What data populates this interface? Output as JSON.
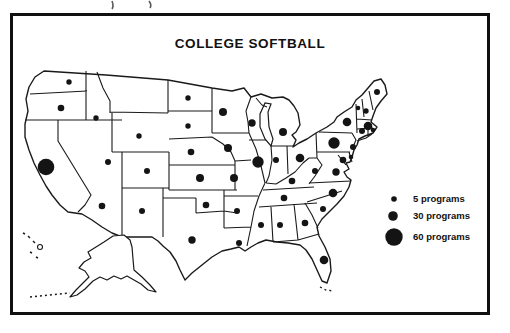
{
  "title": "COLLEGE SOFTBALL",
  "colors": {
    "ink": "#141414",
    "paper": "#ffffff"
  },
  "chart_data": {
    "type": "proportional-symbol-map",
    "title": "COLLEGE SOFTBALL",
    "region": "United States (48 contiguous states drawn, plus Alaska and Hawaii outlines)",
    "unit": "college softball programs per state (dot area ~ program count)",
    "symbol_color": "#141414",
    "legend_position": "right-middle",
    "legend": [
      {
        "label": "5 programs",
        "value": 5,
        "cx": 394,
        "cy": 199,
        "r": 2.8
      },
      {
        "label": "30 programs",
        "value": 30,
        "cx": 393,
        "cy": 216,
        "r": 4.8
      },
      {
        "label": "60 programs",
        "value": 60,
        "cx": 394,
        "cy": 237,
        "r": 8.7
      }
    ],
    "dots": [
      {
        "state": "WA",
        "x": 69,
        "y": 82,
        "r": 2.7,
        "programs_est": 5
      },
      {
        "state": "OR",
        "x": 61,
        "y": 108,
        "r": 3.3,
        "programs_est": 12
      },
      {
        "state": "ID",
        "x": 96,
        "y": 118,
        "r": 2.7,
        "programs_est": 5
      },
      {
        "state": "NV",
        "x": 108,
        "y": 162,
        "r": 3.0,
        "programs_est": 9
      },
      {
        "state": "WY",
        "x": 139,
        "y": 136,
        "r": 2.7,
        "programs_est": 5
      },
      {
        "state": "CO",
        "x": 147,
        "y": 171,
        "r": 3.0,
        "programs_est": 9
      },
      {
        "state": "AZ",
        "x": 102,
        "y": 206,
        "r": 3.3,
        "programs_est": 12
      },
      {
        "state": "NM",
        "x": 142,
        "y": 211,
        "r": 3.0,
        "programs_est": 9
      },
      {
        "state": "CA",
        "x": 46,
        "y": 167,
        "r": 8.3,
        "programs_est": 57
      },
      {
        "state": "ND",
        "x": 188,
        "y": 98,
        "r": 2.7,
        "programs_est": 5
      },
      {
        "state": "SD",
        "x": 188,
        "y": 126,
        "r": 2.7,
        "programs_est": 5
      },
      {
        "state": "NE",
        "x": 191,
        "y": 152,
        "r": 3.3,
        "programs_est": 12
      },
      {
        "state": "KS",
        "x": 200,
        "y": 178,
        "r": 4.0,
        "programs_est": 21
      },
      {
        "state": "OK",
        "x": 206,
        "y": 205,
        "r": 3.3,
        "programs_est": 12
      },
      {
        "state": "TX",
        "x": 192,
        "y": 240,
        "r": 3.7,
        "programs_est": 17
      },
      {
        "state": "MN",
        "x": 223,
        "y": 112,
        "r": 4.0,
        "programs_est": 21
      },
      {
        "state": "IA",
        "x": 228,
        "y": 148,
        "r": 4.0,
        "programs_est": 21
      },
      {
        "state": "MO",
        "x": 234,
        "y": 178,
        "r": 4.0,
        "programs_est": 21
      },
      {
        "state": "AR",
        "x": 237,
        "y": 211,
        "r": 3.0,
        "programs_est": 9
      },
      {
        "state": "LA",
        "x": 239,
        "y": 243,
        "r": 3.0,
        "programs_est": 9
      },
      {
        "state": "WI",
        "x": 252,
        "y": 123,
        "r": 3.7,
        "programs_est": 17
      },
      {
        "state": "IL",
        "x": 258,
        "y": 162,
        "r": 5.7,
        "programs_est": 38
      },
      {
        "state": "IN",
        "x": 276,
        "y": 160,
        "r": 3.0,
        "programs_est": 9
      },
      {
        "state": "MI",
        "x": 283,
        "y": 132,
        "r": 4.0,
        "programs_est": 21
      },
      {
        "state": "OH",
        "x": 300,
        "y": 158,
        "r": 4.3,
        "programs_est": 25
      },
      {
        "state": "KY",
        "x": 292,
        "y": 181,
        "r": 3.3,
        "programs_est": 12
      },
      {
        "state": "TN",
        "x": 284,
        "y": 198,
        "r": 3.3,
        "programs_est": 12
      },
      {
        "state": "MS",
        "x": 261,
        "y": 225,
        "r": 3.0,
        "programs_est": 9
      },
      {
        "state": "AL",
        "x": 280,
        "y": 225,
        "r": 3.0,
        "programs_est": 9
      },
      {
        "state": "GA",
        "x": 305,
        "y": 223,
        "r": 3.3,
        "programs_est": 12
      },
      {
        "state": "FL",
        "x": 324,
        "y": 260,
        "r": 4.3,
        "programs_est": 25
      },
      {
        "state": "SC",
        "x": 323,
        "y": 209,
        "r": 3.0,
        "programs_est": 9
      },
      {
        "state": "NC",
        "x": 333,
        "y": 193,
        "r": 4.3,
        "programs_est": 25
      },
      {
        "state": "VA",
        "x": 336,
        "y": 172,
        "r": 3.7,
        "programs_est": 17
      },
      {
        "state": "WV",
        "x": 315,
        "y": 171,
        "r": 3.0,
        "programs_est": 9
      },
      {
        "state": "PA",
        "x": 334,
        "y": 143,
        "r": 5.7,
        "programs_est": 38
      },
      {
        "state": "NY",
        "x": 347,
        "y": 122,
        "r": 4.3,
        "programs_est": 25
      },
      {
        "state": "NJ",
        "x": 353,
        "y": 147,
        "r": 3.0,
        "programs_est": 9
      },
      {
        "state": "MD",
        "x": 343,
        "y": 160,
        "r": 3.3,
        "programs_est": 12
      },
      {
        "state": "DE",
        "x": 351,
        "y": 157,
        "r": 2.3,
        "programs_est": 3
      },
      {
        "state": "VT",
        "x": 358,
        "y": 108,
        "r": 2.3,
        "programs_est": 3
      },
      {
        "state": "NH",
        "x": 366,
        "y": 111,
        "r": 2.7,
        "programs_est": 5
      },
      {
        "state": "ME",
        "x": 377,
        "y": 92,
        "r": 3.0,
        "programs_est": 9
      },
      {
        "state": "MA",
        "x": 368,
        "y": 126,
        "r": 4.3,
        "programs_est": 25
      },
      {
        "state": "RI",
        "x": 373,
        "y": 130,
        "r": 2.3,
        "programs_est": 3
      },
      {
        "state": "CT",
        "x": 362,
        "y": 131,
        "r": 3.0,
        "programs_est": 9
      }
    ],
    "states_without_symbol": [
      "MT",
      "AK",
      "HI"
    ]
  }
}
